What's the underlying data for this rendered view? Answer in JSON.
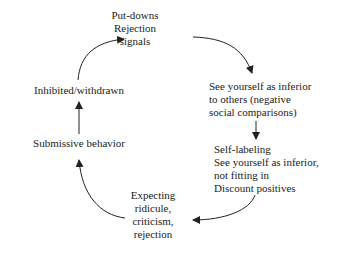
{
  "diagram": {
    "type": "cycle",
    "colors": {
      "text": "#222222",
      "arrow": "#222222",
      "background": "#ffffff"
    },
    "nodes": [
      {
        "id": "putdowns",
        "lines": [
          "Put-downs",
          "Rejection",
          "signals"
        ]
      },
      {
        "id": "inferior",
        "lines": [
          "See yourself as inferior",
          "to others (negative",
          "social comparisons)"
        ]
      },
      {
        "id": "selflabel",
        "lines": [
          "Self-labeling",
          "See yourself as inferior,",
          "not fitting in",
          "Discount positives"
        ]
      },
      {
        "id": "expecting",
        "lines": [
          "Expecting",
          "ridicule,",
          "criticism,",
          "rejection"
        ]
      },
      {
        "id": "submissive",
        "lines": [
          "Submissive behavior"
        ]
      },
      {
        "id": "inhibited",
        "lines": [
          "Inhibited/withdrawn"
        ]
      }
    ],
    "edges": [
      {
        "from": "putdowns",
        "to": "inferior"
      },
      {
        "from": "inferior",
        "to": "selflabel"
      },
      {
        "from": "selflabel",
        "to": "expecting"
      },
      {
        "from": "expecting",
        "to": "submissive"
      },
      {
        "from": "submissive",
        "to": "inhibited"
      },
      {
        "from": "inhibited",
        "to": "putdowns"
      }
    ]
  }
}
